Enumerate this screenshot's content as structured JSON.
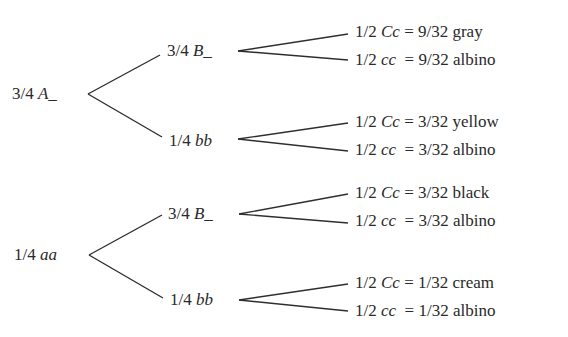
{
  "diagram": {
    "colors": {
      "line": "#2e2e2e",
      "text": "#2a2a2a"
    },
    "root_nodes": [
      {
        "prob": "3/4",
        "genotype": "A_"
      },
      {
        "prob": "1/4",
        "genotype": "aa"
      }
    ],
    "second_nodes": [
      {
        "prob": "3/4",
        "genotype": "B_"
      },
      {
        "prob": "1/4",
        "genotype": "bb"
      },
      {
        "prob": "3/4",
        "genotype": "B_"
      },
      {
        "prob": "1/4",
        "genotype": "bb"
      }
    ],
    "outcomes": [
      {
        "prob": "1/2",
        "genotype": "Cc",
        "result": "= 9/32 gray"
      },
      {
        "prob": "1/2",
        "genotype": "cc",
        "result": "= 9/32 albino"
      },
      {
        "prob": "1/2",
        "genotype": "Cc",
        "result": "= 3/32 yellow"
      },
      {
        "prob": "1/2",
        "genotype": "cc",
        "result": "= 3/32 albino"
      },
      {
        "prob": "1/2",
        "genotype": "Cc",
        "result": "= 3/32 black"
      },
      {
        "prob": "1/2",
        "genotype": "cc",
        "result": "= 3/32 albino"
      },
      {
        "prob": "1/2",
        "genotype": "Cc",
        "result": "= 1/32 cream"
      },
      {
        "prob": "1/2",
        "genotype": "cc",
        "result": "= 1/32 albino"
      }
    ]
  }
}
